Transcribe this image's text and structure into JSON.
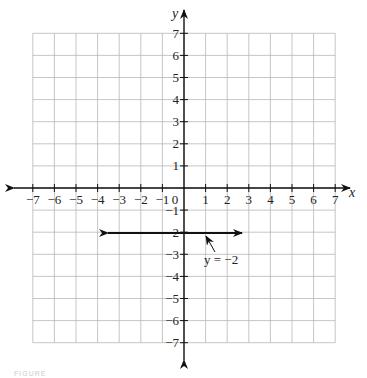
{
  "graph": {
    "x_axis_label": "x",
    "y_axis_label": "y",
    "x_ticks": [
      "-7",
      "-6",
      "-5",
      "-4",
      "-3",
      "-2",
      "-1",
      "0",
      "1",
      "2",
      "3",
      "4",
      "5",
      "6",
      "7"
    ],
    "y_ticks": [
      "7",
      "6",
      "5",
      "4",
      "3",
      "2",
      "1",
      "-1",
      "-2",
      "-3",
      "-4",
      "-5",
      "-6",
      "-7"
    ],
    "line_label": "y = −2",
    "caption": "FIGURE"
  },
  "chart_data": {
    "type": "line",
    "title": "",
    "xlabel": "x",
    "ylabel": "y",
    "xlim": [
      -7,
      7
    ],
    "ylim": [
      -7,
      7
    ],
    "grid": true,
    "series": [
      {
        "name": "y = -2",
        "x": [
          -3.5,
          2.7
        ],
        "y": [
          -2,
          -2
        ],
        "arrows": "both"
      }
    ],
    "annotations": [
      {
        "text": "y = −2",
        "points_to": [
          0.8,
          -2
        ]
      }
    ]
  }
}
